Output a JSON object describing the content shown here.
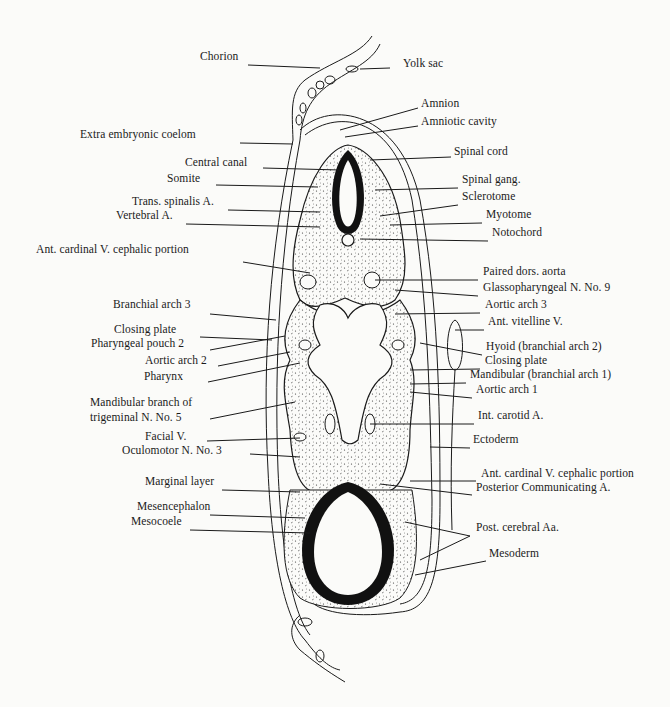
{
  "figure": {
    "colors": {
      "ink": "#1a1a1a",
      "paper": "#fbfbf9"
    }
  },
  "labels_left": [
    {
      "id": "chorion",
      "text": "Chorion",
      "x": 200,
      "y": 57
    },
    {
      "id": "extra-embryonic-coelom",
      "text": "Extra embryonic coelom",
      "x": 80,
      "y": 135
    },
    {
      "id": "central-canal",
      "text": "Central canal",
      "x": 185,
      "y": 163
    },
    {
      "id": "somite",
      "text": "Somite",
      "x": 167,
      "y": 179
    },
    {
      "id": "trans-spinalis-a",
      "text": "Trans. spinalis A.",
      "x": 132,
      "y": 202
    },
    {
      "id": "vertebral-a",
      "text": "Vertebral A.",
      "x": 116,
      "y": 216
    },
    {
      "id": "ant-cardinal-v-upper",
      "text": "Ant. cardinal V. cephalic portion",
      "x": 36,
      "y": 250
    },
    {
      "id": "branchial-arch-3",
      "text": "Branchial arch 3",
      "x": 113,
      "y": 305
    },
    {
      "id": "closing-plate-left",
      "text": "Closing plate",
      "x": 114,
      "y": 330
    },
    {
      "id": "pharyngeal-pouch-2",
      "text": "Pharyngeal pouch 2",
      "x": 91,
      "y": 344
    },
    {
      "id": "aortic-arch-2",
      "text": "Aortic arch 2",
      "x": 145,
      "y": 361
    },
    {
      "id": "pharynx",
      "text": "Pharynx",
      "x": 144,
      "y": 377
    },
    {
      "id": "mandibular-branch",
      "text": "Mandibular branch of",
      "x": 90,
      "y": 403
    },
    {
      "id": "trigeminal-n5",
      "text": "trigeminal N. No. 5",
      "x": 90,
      "y": 418
    },
    {
      "id": "facial-v",
      "text": "Facial V.",
      "x": 145,
      "y": 437
    },
    {
      "id": "oculomotor-n3",
      "text": "Oculomotor N. No. 3",
      "x": 122,
      "y": 451
    },
    {
      "id": "marginal-layer",
      "text": "Marginal layer",
      "x": 145,
      "y": 482
    },
    {
      "id": "mesencephalon",
      "text": "Mesencephalon",
      "x": 137,
      "y": 507
    },
    {
      "id": "mesocoele",
      "text": "Mesocoele",
      "x": 131,
      "y": 522
    }
  ],
  "labels_right": [
    {
      "id": "yolk-sac",
      "text": "Yolk sac",
      "x": 403,
      "y": 64
    },
    {
      "id": "amnion",
      "text": "Amnion",
      "x": 421,
      "y": 104
    },
    {
      "id": "amniotic-cavity",
      "text": "Amniotic cavity",
      "x": 421,
      "y": 122
    },
    {
      "id": "spinal-cord",
      "text": "Spinal cord",
      "x": 454,
      "y": 152
    },
    {
      "id": "spinal-gang",
      "text": "Spinal gang.",
      "x": 462,
      "y": 180
    },
    {
      "id": "sclerotome",
      "text": "Sclerotome",
      "x": 462,
      "y": 197
    },
    {
      "id": "myotome",
      "text": "Myotome",
      "x": 486,
      "y": 215
    },
    {
      "id": "notochord",
      "text": "Notochord",
      "x": 492,
      "y": 233
    },
    {
      "id": "paired-dors-aorta",
      "text": "Paired dors. aorta",
      "x": 483,
      "y": 272
    },
    {
      "id": "glossopharyngeal-n9",
      "text": "Glassopharyngeal N. No. 9",
      "x": 483,
      "y": 288
    },
    {
      "id": "aortic-arch-3",
      "text": "Aortic arch 3",
      "x": 485,
      "y": 305
    },
    {
      "id": "ant-vitelline-v",
      "text": "Ant. vitelline V.",
      "x": 488,
      "y": 322
    },
    {
      "id": "hyoid",
      "text": "Hyoid (branchial arch 2)",
      "x": 486,
      "y": 347
    },
    {
      "id": "closing-plate-right",
      "text": "Closing plate",
      "x": 485,
      "y": 361
    },
    {
      "id": "mandibular-arch-1",
      "text": "Mandibular (branchial arch 1)",
      "x": 470,
      "y": 375
    },
    {
      "id": "aortic-arch-1",
      "text": "Aortic arch 1",
      "x": 476,
      "y": 390
    },
    {
      "id": "int-carotid-a",
      "text": "Int. carotid A.",
      "x": 478,
      "y": 416
    },
    {
      "id": "ectoderm",
      "text": "Ectoderm",
      "x": 473,
      "y": 440
    },
    {
      "id": "ant-cardinal-v-lower",
      "text": "Ant. cardinal V. cephalic portion",
      "x": 481,
      "y": 474
    },
    {
      "id": "posterior-communicating-a",
      "text": "Posterior Communicating A.",
      "x": 476,
      "y": 488
    },
    {
      "id": "post-cerebral-aa",
      "text": "Post. cerebral Aa.",
      "x": 476,
      "y": 528
    },
    {
      "id": "mesoderm",
      "text": "Mesoderm",
      "x": 489,
      "y": 554
    }
  ],
  "leader_lines": [
    [
      248,
      65,
      320,
      68
    ],
    [
      240,
      143,
      293,
      144
    ],
    [
      263,
      168,
      340,
      170
    ],
    [
      216,
      185,
      318,
      187
    ],
    [
      228,
      210,
      320,
      212
    ],
    [
      186,
      224,
      320,
      227
    ],
    [
      243,
      262,
      310,
      273
    ],
    [
      210,
      314,
      276,
      320
    ],
    [
      200,
      337,
      272,
      340
    ],
    [
      210,
      350,
      285,
      336
    ],
    [
      218,
      366,
      290,
      352
    ],
    [
      208,
      382,
      300,
      363
    ],
    [
      210,
      419,
      295,
      402
    ],
    [
      207,
      441,
      300,
      438
    ],
    [
      250,
      454,
      300,
      457
    ],
    [
      222,
      490,
      300,
      492
    ],
    [
      210,
      515,
      305,
      518
    ],
    [
      190,
      530,
      310,
      533
    ],
    [
      390,
      68,
      360,
      69
    ],
    [
      418,
      108,
      340,
      130
    ],
    [
      418,
      126,
      345,
      137
    ],
    [
      451,
      157,
      370,
      160
    ],
    [
      458,
      188,
      375,
      190
    ],
    [
      458,
      205,
      380,
      216
    ],
    [
      482,
      223,
      390,
      225
    ],
    [
      488,
      241,
      360,
      239
    ],
    [
      478,
      280,
      375,
      280
    ],
    [
      478,
      296,
      395,
      290
    ],
    [
      480,
      313,
      395,
      314
    ],
    [
      484,
      330,
      455,
      330
    ],
    [
      482,
      355,
      420,
      343
    ],
    [
      480,
      369,
      410,
      370
    ],
    [
      466,
      383,
      410,
      384
    ],
    [
      472,
      398,
      410,
      392
    ],
    [
      474,
      424,
      370,
      424
    ],
    [
      470,
      448,
      430,
      447
    ],
    [
      476,
      481,
      410,
      481
    ],
    [
      472,
      495,
      380,
      484
    ],
    [
      470,
      536,
      420,
      560
    ],
    [
      470,
      536,
      405,
      522
    ],
    [
      486,
      561,
      415,
      575
    ]
  ]
}
